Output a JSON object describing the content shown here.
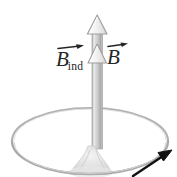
{
  "figure": {
    "kind": "physics-diagram",
    "width": 177,
    "height": 177,
    "background_color": "#ffffff"
  },
  "labels": {
    "induced_field": {
      "symbol": "B",
      "subscript": "ind",
      "accent": "vector-arrow",
      "color": "#262626"
    },
    "applied_field": {
      "symbol": "B",
      "subscript": "",
      "accent": "vector-arrow",
      "color": "#262626"
    }
  },
  "field_arrow": {
    "name": "vertical-field-arrow",
    "direction": "up",
    "shaft_color": "#c2c2c2",
    "shaft_highlight": "#dedede",
    "shaft_shadow": "#a8a8a8",
    "outline_color": "#9a9a9a",
    "arrowhead_count": 2,
    "arrowhead_fill": "#e8e8e8"
  },
  "loop": {
    "name": "conducting-loop",
    "shape": "ellipse",
    "stroke_color": "#a9a9a9",
    "inner_stroke_color": "#cfcfcf",
    "center_x": 90,
    "center_y": 141,
    "radius_x": 78,
    "radius_y": 33
  },
  "hand": {
    "name": "hand-shape",
    "color": "#dcdcdc",
    "outline_color": "#c4c4c4"
  },
  "motion_arrow": {
    "name": "motion-direction-arrow",
    "direction": "up-right",
    "color": "#111111"
  },
  "icons": {
    "arrowhead": "triangle-up-icon",
    "vector": "vector-arrow-icon",
    "motion": "arrow-up-right-icon"
  }
}
